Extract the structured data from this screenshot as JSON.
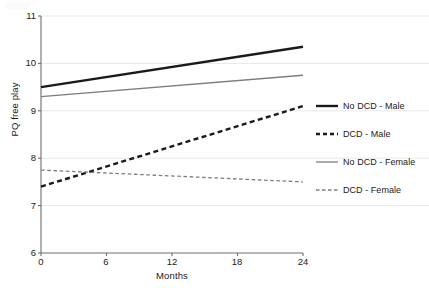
{
  "chart_data": {
    "type": "line",
    "title": "",
    "xlabel": "Months",
    "ylabel": "PQ free play",
    "x": [
      0,
      24
    ],
    "xticks": [
      0,
      6,
      12,
      18,
      24
    ],
    "yticks": [
      6,
      7,
      8,
      9,
      10,
      11
    ],
    "xlim": [
      0,
      24
    ],
    "ylim": [
      6,
      11
    ],
    "grid": "horizontal",
    "legend_position": "right",
    "series": [
      {
        "name": "No DCD - Male",
        "values": [
          9.5,
          10.35
        ],
        "color": "#1a1a1a",
        "style": "solid",
        "width": 2.4
      },
      {
        "name": "DCD - Male",
        "values": [
          7.4,
          9.1
        ],
        "color": "#1a1a1a",
        "style": "dashed",
        "width": 2.4
      },
      {
        "name": "No DCD - Female",
        "values": [
          9.3,
          9.75
        ],
        "color": "#7d7d7d",
        "style": "solid",
        "width": 1.3
      },
      {
        "name": "DCD - Female",
        "values": [
          7.75,
          7.5
        ],
        "color": "#7d7d7d",
        "style": "dashed",
        "width": 1.3
      }
    ]
  },
  "axes": {
    "y_tick_labels": [
      "11",
      "10",
      "9",
      "8",
      "7",
      "6"
    ],
    "x_tick_labels": [
      "0",
      "6",
      "12",
      "18",
      "24"
    ],
    "y_axis_title": "PQ free play",
    "x_axis_title": "Months"
  },
  "legend": {
    "items": [
      {
        "label": "No DCD - Male"
      },
      {
        "label": "DCD - Male"
      },
      {
        "label": "No DCD - Female"
      },
      {
        "label": "DCD - Female"
      }
    ]
  },
  "colors": {
    "line_dark": "#1a1a1a",
    "line_gray": "#7d7d7d",
    "gridline": "#e8e8e8",
    "axis": "#6e6e6e",
    "background": "#ffffff"
  }
}
